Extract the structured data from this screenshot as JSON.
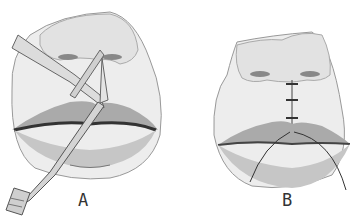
{
  "figure": {
    "panels": [
      {
        "id": "A",
        "label": "A",
        "description": "upper lip incision with scissors and forceps"
      },
      {
        "id": "B",
        "label": "B",
        "description": "sutured upper lip"
      }
    ]
  },
  "colors": {
    "skin": "#ececec",
    "shade": "#bdbdbd",
    "lip": "#a9a9a9",
    "line": "#555555",
    "instrument": "#d8d8d8"
  }
}
